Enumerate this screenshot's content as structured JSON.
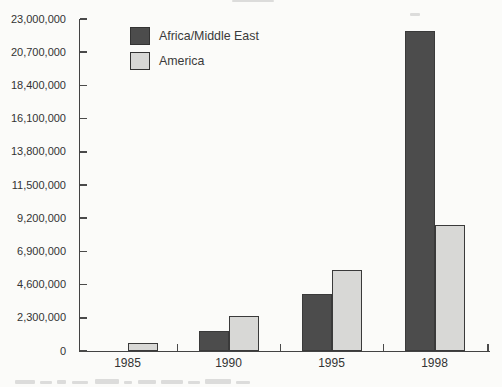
{
  "figure": {
    "background_color": "#fbfbf9",
    "axis_color": "#434343",
    "text_color": "#333333"
  },
  "legend": {
    "items": [
      {
        "label": "Africa/Middle East",
        "color": "#4c4c4c"
      },
      {
        "label": "America",
        "color": "#d8d8d6"
      }
    ]
  },
  "chart_data": {
    "type": "bar",
    "title": "",
    "xlabel": "",
    "ylabel": "",
    "categories": [
      "1985",
      "1990",
      "1995",
      "1998"
    ],
    "series": [
      {
        "name": "Africa/Middle East",
        "color": "#4c4c4c",
        "values": [
          0,
          1400000,
          3950000,
          22200000
        ]
      },
      {
        "name": "America",
        "color": "#d8d8d6",
        "values": [
          550000,
          2400000,
          5600000,
          8700000
        ]
      }
    ],
    "ylim": [
      0,
      23000000
    ],
    "ytick_step": 2300000,
    "ytick_labels": [
      "0",
      "2,300,000",
      "4,600,000",
      "6,900,000",
      "9,200,000",
      "11,500,000",
      "13,800,000",
      "16,100,000",
      "18,400,000",
      "20,700,000",
      "23,000,000"
    ],
    "xtick_labels": [
      "1985",
      "1990",
      "1995",
      "1998"
    ],
    "grid": false,
    "legend_position": "inside-top-left"
  }
}
